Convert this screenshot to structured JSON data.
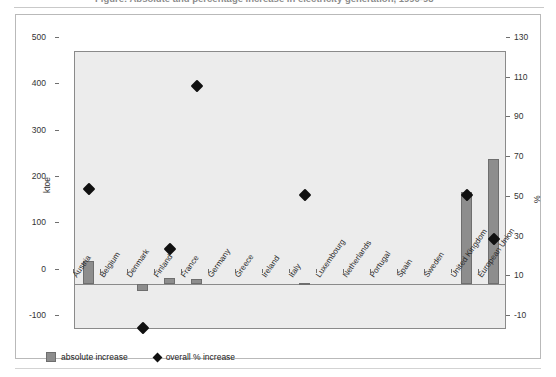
{
  "figure": {
    "title": "Figure: Absolute and percentage increase in electricity generation, 1990-98",
    "left_axis_label": "ktoe",
    "right_axis_label": "%"
  },
  "legend": {
    "items": [
      {
        "label": "absolute increase",
        "marker": "square",
        "color": "#8d8d8d"
      },
      {
        "label": "overall % increase",
        "marker": "diamond",
        "color": "#111111"
      }
    ]
  },
  "axes": {
    "left_ticks": [
      "500",
      "400",
      "300",
      "200",
      "100",
      "0",
      "-100"
    ],
    "right_ticks": [
      "130",
      "110",
      "90",
      "70",
      "50",
      "30",
      "10",
      "-10"
    ]
  },
  "chart_data": {
    "type": "bar",
    "title": "Absolute and percentage increase in electricity generation, 1990-98",
    "xlabel": "",
    "ylabel": "ktoe",
    "y2label": "%",
    "ylim": [
      -100,
      500
    ],
    "y2lim": [
      -10,
      130
    ],
    "grid": false,
    "legend_position": "bottom-left",
    "categories": [
      "Austria",
      "Belgium",
      "Denmark",
      "Finland",
      "France",
      "Germany",
      "Greece",
      "Ireland",
      "Italy",
      "Luxembourg",
      "Netherlands",
      "Portugal",
      "Spain",
      "Sweden",
      "United Kingdom",
      "European Union"
    ],
    "series": [
      {
        "name": "absolute increase",
        "type": "bar",
        "axis": "left",
        "unit": "ktoe",
        "color": "#8d8d8d",
        "values": [
          48,
          0,
          -16,
          13,
          9,
          0,
          0,
          0,
          2,
          0,
          0,
          0,
          0,
          0,
          197,
          270
        ]
      },
      {
        "name": "overall % increase",
        "type": "scatter",
        "axis": "right",
        "unit": "%",
        "color": "#111111",
        "marker": "diamond",
        "values": [
          61,
          null,
          -9,
          31,
          113,
          null,
          null,
          null,
          58,
          null,
          null,
          null,
          null,
          null,
          58,
          36
        ]
      }
    ]
  }
}
